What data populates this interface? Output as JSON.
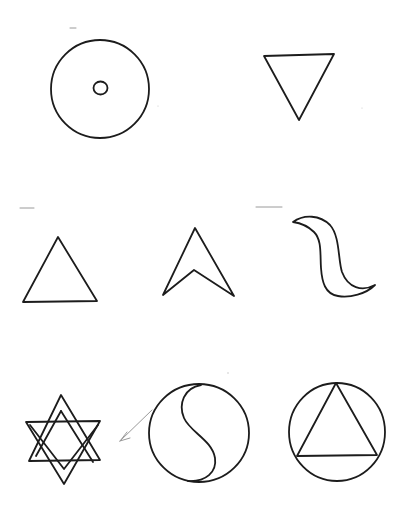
{
  "page": {
    "background": "#ffffff",
    "ink_color": "#1c1c1c",
    "pencil_color": "#9a9a9a"
  },
  "symbols": [
    {
      "name": "circle-with-dot",
      "row": 1,
      "col": 1
    },
    {
      "name": "inverted-triangle",
      "row": 1,
      "col": 3
    },
    {
      "name": "upward-triangle",
      "row": 2,
      "col": 1
    },
    {
      "name": "arrowhead",
      "row": 2,
      "col": 2
    },
    {
      "name": "wave-crescent",
      "row": 2,
      "col": 3
    },
    {
      "name": "hexagram-star",
      "row": 3,
      "col": 1
    },
    {
      "name": "yin-yang-circle",
      "row": 3,
      "col": 2
    },
    {
      "name": "circle-with-triangle",
      "row": 3,
      "col": 3
    }
  ],
  "annotations": [
    {
      "name": "pencil-arrow",
      "from_symbol": "yin-yang-circle",
      "to_symbol": "hexagram-star"
    }
  ]
}
